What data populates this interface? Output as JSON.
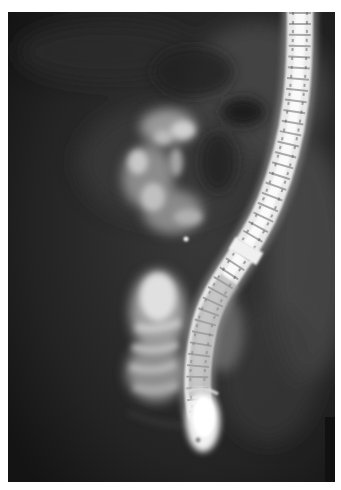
{
  "image": {
    "kind": "fluoroscopic radiograph",
    "subject": "endoscope in duodenum with contrast-filled structures",
    "border_color": "#ffffff",
    "background_tone": "#1c1c1c",
    "colors": {
      "dark_field": "#1c1c1c",
      "soft_tissue": "#4a4a4a",
      "contrast_mid": "#8a8a8a",
      "contrast_bright": "#d8d8d8",
      "scope_highlight": "#f2f2f2"
    },
    "elements": [
      {
        "name": "endoscope-shaft",
        "description": "bright segmented tube curving from top-right down to lower-center"
      },
      {
        "name": "endoscope-tip",
        "description": "bright bulbous tip near bottom center"
      },
      {
        "name": "contrast-upper-mass",
        "description": "mottled bright contrast region at upper-left-center"
      },
      {
        "name": "contrast-lower-folds",
        "description": "bright folded duodenal contrast left of scope tip"
      },
      {
        "name": "bowel-gas-shadow",
        "description": "dark rounded shadows in upper field"
      }
    ]
  }
}
